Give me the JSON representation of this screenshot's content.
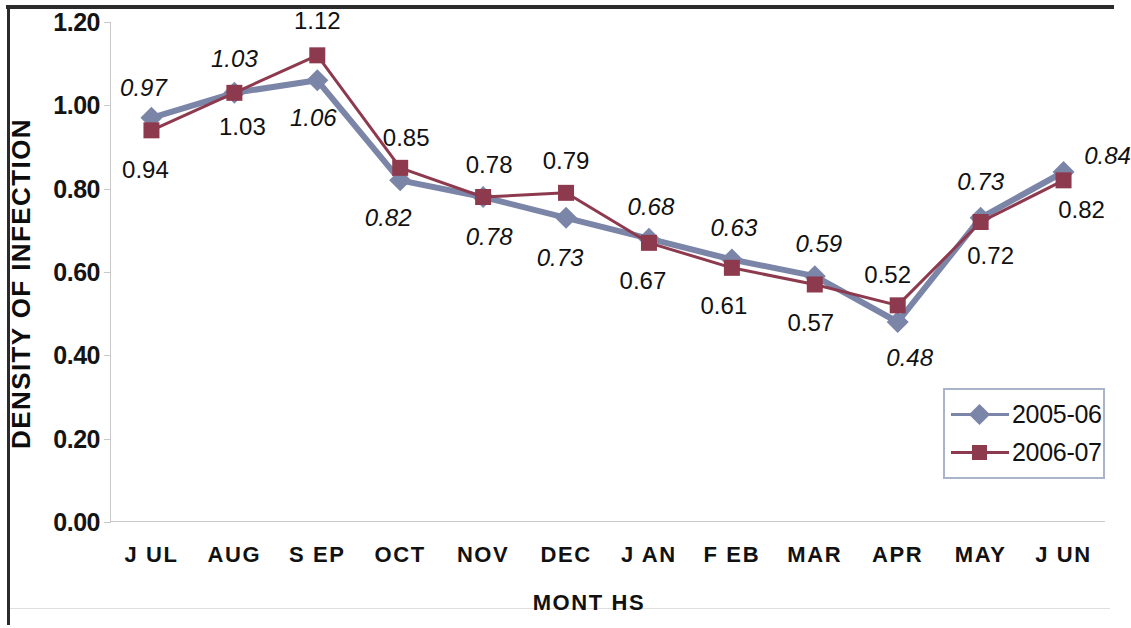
{
  "chart_data": {
    "type": "line",
    "title": "",
    "xlabel": "MONT HS",
    "ylabel": "DENSITY OF INFECTION",
    "categories": [
      "J UL",
      "AUG",
      "S EP",
      "OCT",
      "NOV",
      "DEC",
      "J AN",
      "F EB",
      "MAR",
      "APR",
      "MAY",
      "J UN"
    ],
    "ylim": [
      0.0,
      1.2
    ],
    "ytick_labels": [
      "1.20",
      "1.00",
      "0.80",
      "0.60",
      "0.40",
      "0.20",
      "0.00"
    ],
    "ytick_values": [
      1.2,
      1.0,
      0.8,
      0.6,
      0.4,
      0.2,
      0.0
    ],
    "grid": false,
    "legend_position": "bottom-right",
    "series": [
      {
        "name": "2005-06",
        "color": "#7b85a8",
        "marker": "diamond",
        "label_style": "italic",
        "values": [
          0.97,
          1.03,
          1.06,
          0.82,
          0.78,
          0.73,
          0.68,
          0.63,
          0.59,
          0.48,
          0.73,
          0.84
        ],
        "value_labels": [
          "0.97",
          "1.03",
          "1.06",
          "0.82",
          "0.78",
          "0.73",
          "0.68",
          "0.63",
          "0.59",
          "0.48",
          "0.73",
          "0.84"
        ]
      },
      {
        "name": "2006-07",
        "color": "#8e3a4e",
        "marker": "square",
        "label_style": "normal",
        "values": [
          0.94,
          1.03,
          1.12,
          0.85,
          0.78,
          0.79,
          0.67,
          0.61,
          0.57,
          0.52,
          0.72,
          0.82
        ],
        "value_labels": [
          "0.94",
          "1.03",
          "1.12",
          "0.85",
          "0.78",
          "0.79",
          "0.67",
          "0.61",
          "0.57",
          "0.52",
          "0.72",
          "0.82"
        ]
      }
    ]
  },
  "legend": {
    "items": [
      {
        "label": "2005-06"
      },
      {
        "label": "2006-07"
      }
    ]
  },
  "colors": {
    "series_2005_06": "#7b85a8",
    "series_2006_07": "#8e3a4e",
    "axis": "#c9c9c9",
    "text": "#111111",
    "legend_border": "#a9b3c9",
    "frame": "#2b2b2b"
  }
}
